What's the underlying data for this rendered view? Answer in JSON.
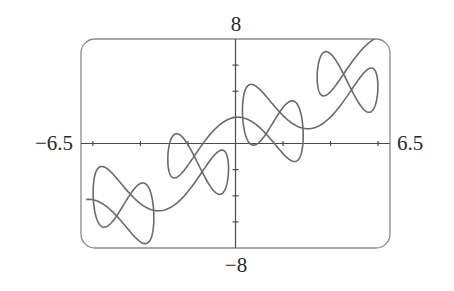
{
  "chart_data": {
    "type": "line",
    "title": "",
    "xlabel": "",
    "ylabel": "",
    "parametric": {
      "x": "t + 2 sin(2t)",
      "y": "t + 2 cos(5t)",
      "t_range": [
        -6.2832,
        6.2832
      ],
      "samples": 1200
    },
    "xlim": [
      -6.5,
      6.5
    ],
    "ylim": [
      -8,
      8
    ],
    "x_ticks": [
      -6,
      -4,
      -2,
      2,
      4,
      6
    ],
    "y_ticks": [
      -6,
      -4,
      -2,
      2,
      4,
      6
    ],
    "axis_labels": {
      "x_min": "−6.5",
      "x_max": "6.5",
      "y_max": "8",
      "y_min": "−8"
    },
    "grid": false,
    "legend": null,
    "sample_points": [
      {
        "t": -6.2832,
        "x": -6.28,
        "y": -4.28
      },
      {
        "t": -4.7124,
        "x": -4.71,
        "y": -4.71
      },
      {
        "t": -3.1416,
        "x": -3.14,
        "y": -5.14
      },
      {
        "t": -1.5708,
        "x": -1.57,
        "y": -1.57
      },
      {
        "t": 0,
        "x": 0.0,
        "y": 2.0
      },
      {
        "t": 1.5708,
        "x": 1.57,
        "y": 1.57
      },
      {
        "t": 3.1416,
        "x": 3.14,
        "y": 1.14
      },
      {
        "t": 4.7124,
        "x": 4.71,
        "y": 4.71
      },
      {
        "t": 6.2832,
        "x": 6.28,
        "y": 8.28
      }
    ]
  },
  "style": {
    "curve_color": "#6a6a6a",
    "axis_color": "#4a4a4a",
    "frame_color": "#8a8a8a",
    "text_color": "#2a2a2a"
  },
  "labels": {
    "x_min": "−6.5",
    "x_max": "6.5",
    "y_max": "8",
    "y_min": "−8"
  }
}
